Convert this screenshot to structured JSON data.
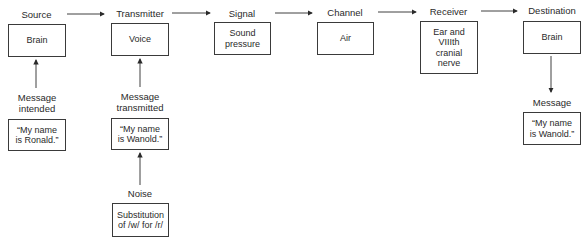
{
  "diagram": {
    "type": "communication-flow",
    "stages": [
      {
        "label": "Source",
        "box": "Brain"
      },
      {
        "label": "Transmitter",
        "box": "Voice"
      },
      {
        "label": "Signal",
        "box": "Sound\npressure"
      },
      {
        "label": "Channel",
        "box": "Air"
      },
      {
        "label": "Receiver",
        "box": "Ear and\nVIIIth\ncranial\nnerve"
      },
      {
        "label": "Destination",
        "box": "Brain"
      }
    ],
    "source_input": {
      "label": "Message\nintended",
      "box": "“My name\nis Ronald.”"
    },
    "transmitter_input": {
      "label": "Message\ntransmitted",
      "box": "“My name\nis Wanold.”"
    },
    "noise": {
      "label": "Noise",
      "box": "Substitution\nof /w/ for /r/"
    },
    "destination_output": {
      "label": "Message",
      "box": "“My name\nis Wanold.”"
    }
  }
}
